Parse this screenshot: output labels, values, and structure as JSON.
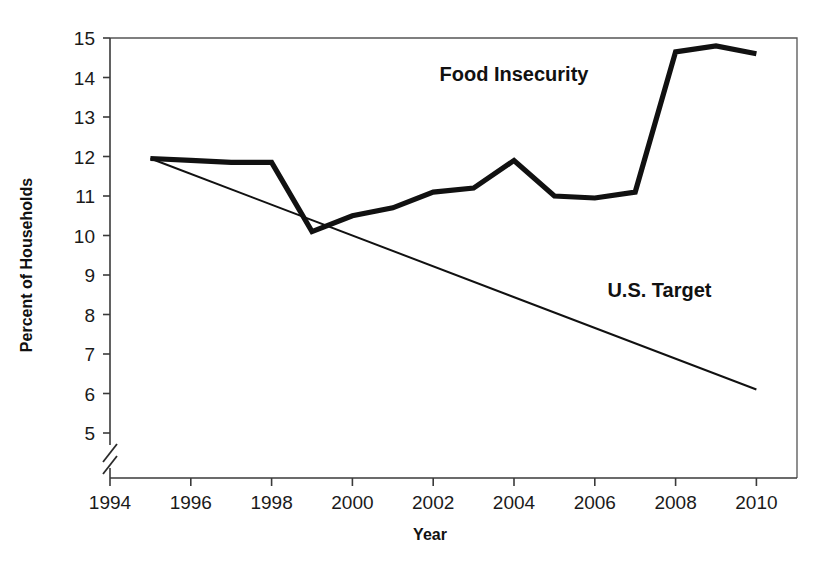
{
  "chart_data": {
    "type": "line",
    "title": "",
    "xlabel": "Year",
    "ylabel": "Percent of Households",
    "xlim": [
      1994,
      2011
    ],
    "ylim": [
      5,
      15
    ],
    "y_axis_break": true,
    "y_axis_break_note": "axis break below 5",
    "grid": false,
    "legend_position": "inline-annotations",
    "xticks": [
      1994,
      1996,
      1998,
      2000,
      2002,
      2004,
      2006,
      2008,
      2010
    ],
    "xtick_labels": [
      "1994",
      "1996",
      "1998",
      "2000",
      "2002",
      "2004",
      "2006",
      "2008",
      "2010"
    ],
    "yticks": [
      5,
      6,
      7,
      8,
      9,
      10,
      11,
      12,
      13,
      14,
      15
    ],
    "ytick_labels": [
      "5",
      "6",
      "7",
      "8",
      "9",
      "10",
      "11",
      "12",
      "13",
      "14",
      "15"
    ],
    "series": [
      {
        "name": "Food Insecurity",
        "style": "thick-solid",
        "color": "#111111",
        "x": [
          1995,
          1996,
          1997,
          1998,
          1999,
          2000,
          2001,
          2002,
          2003,
          2004,
          2005,
          2006,
          2007,
          2008,
          2009,
          2010
        ],
        "values": [
          11.95,
          11.9,
          11.85,
          11.85,
          10.1,
          10.5,
          10.7,
          11.1,
          11.2,
          11.9,
          11.0,
          10.95,
          11.1,
          14.65,
          14.8,
          14.6
        ]
      },
      {
        "name": "U.S. Target",
        "style": "thin-solid",
        "color": "#111111",
        "x": [
          1995,
          2010
        ],
        "values": [
          11.95,
          6.1
        ]
      }
    ],
    "annotations": [
      {
        "text": "Food Insecurity",
        "x": 2004.0,
        "y": 13.9
      },
      {
        "text": "U.S. Target",
        "x": 2007.6,
        "y": 8.45
      }
    ]
  },
  "axes": {
    "y_title": "Percent of Households",
    "x_title": "Year"
  },
  "labels": {
    "food_insecurity": "Food Insecurity",
    "us_target": "U.S. Target"
  },
  "colors": {
    "line": "#111111",
    "axis": "#3a3a3a",
    "frame": "#555555",
    "background": "#ffffff"
  }
}
